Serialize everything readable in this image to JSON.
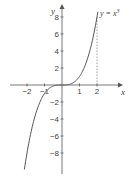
{
  "chart_data": {
    "type": "line",
    "title": "",
    "xlabel": "x",
    "ylabel": "y",
    "function_label": "y = x³",
    "function": "x^3",
    "xlim": [
      -2.2,
      2.6
    ],
    "ylim": [
      -10,
      9
    ],
    "x_ticks": [
      -2,
      -1,
      1,
      2
    ],
    "x_tick_labels": [
      "−2",
      "−1",
      "1",
      "2"
    ],
    "y_ticks": [
      8,
      6,
      4,
      2,
      -2,
      -4,
      -6,
      -8
    ],
    "y_tick_labels": [
      "8",
      "6",
      "4",
      "2",
      "−2",
      "−4",
      "−6",
      "−8"
    ],
    "grid": false,
    "annotations": [
      {
        "type": "dashed-vertical-line",
        "x": 2,
        "from_y": 0,
        "to_y": 8
      }
    ],
    "series": [
      {
        "name": "y = x³",
        "x": [
          -2.15,
          -2,
          -1.5,
          -1,
          -0.5,
          0,
          0.5,
          1,
          1.5,
          2,
          2.05
        ],
        "values": [
          -9.94,
          -8,
          -3.375,
          -1,
          -0.125,
          0,
          0.125,
          1,
          3.375,
          8,
          8.6
        ]
      }
    ]
  },
  "labels": {
    "x_axis": "x",
    "y_axis": "y",
    "function": "y = x",
    "function_exp": "3"
  }
}
